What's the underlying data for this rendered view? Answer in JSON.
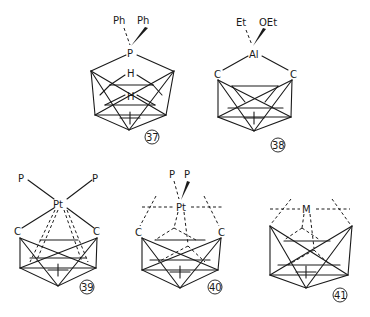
{
  "figure": {
    "structures": [
      {
        "id": "37",
        "ligands": [
          "Ph",
          "Ph"
        ],
        "center": "P",
        "cage_atoms": [
          "H",
          "H"
        ],
        "label": "37"
      },
      {
        "id": "38",
        "ligands": [
          "Et",
          "OEt"
        ],
        "center": "Al",
        "cage_atoms": [
          "C",
          "C"
        ],
        "label": "38"
      },
      {
        "id": "39",
        "ligands": [
          "P",
          "P"
        ],
        "center": "Pt",
        "cage_atoms": [
          "C",
          "C"
        ],
        "label": "39"
      },
      {
        "id": "40",
        "ligands": [
          "P",
          "P"
        ],
        "center": "Pt",
        "cage_atoms": [
          "C",
          "C"
        ],
        "label": "40"
      },
      {
        "id": "41",
        "ligands": [],
        "center": "M",
        "cage_atoms": [],
        "label": "41"
      }
    ]
  }
}
